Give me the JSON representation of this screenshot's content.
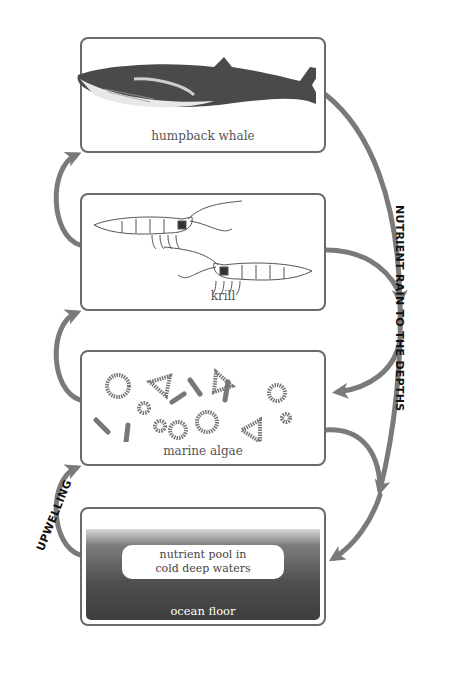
{
  "diagram": {
    "nodes": [
      {
        "id": "whale",
        "label": "humpback whale",
        "illustration": "humpback-whale"
      },
      {
        "id": "krill",
        "label": "krill",
        "illustration": "two-krill"
      },
      {
        "id": "algae",
        "label": "marine algae",
        "illustration": "diatoms-rings-triangles-rods"
      },
      {
        "id": "ocean",
        "label": "ocean floor",
        "inner_label_line1": "nutrient pool in",
        "inner_label_line2": "cold deep waters"
      }
    ],
    "edges": [
      {
        "from": "ocean",
        "to": "algae",
        "side": "left",
        "label": "UPWELLING"
      },
      {
        "from": "algae",
        "to": "krill",
        "side": "left"
      },
      {
        "from": "krill",
        "to": "whale",
        "side": "left"
      },
      {
        "from": "whale",
        "to": "ocean",
        "side": "right",
        "label": "NUTRIENT RAIN TO THE DEPTHS"
      },
      {
        "from": "krill",
        "to": "ocean",
        "side": "right"
      },
      {
        "from": "whale",
        "to": "algae",
        "side": "right"
      },
      {
        "from": "algae",
        "to": "ocean",
        "side": "right"
      }
    ],
    "side_labels": {
      "right": "NUTRIENT RAIN TO THE DEPTHS",
      "left": "UPWELLING"
    },
    "colors": {
      "arrow": "#7a7a7a",
      "box_border": "#6a6a6a",
      "ocean_dark": "#444444",
      "label_text": "#555555"
    }
  }
}
